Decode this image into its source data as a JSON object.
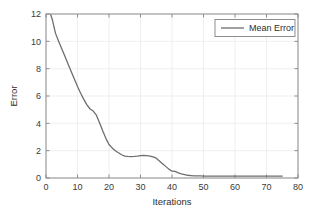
{
  "chart_data": {
    "type": "line",
    "title": "",
    "xlabel": "Iterations",
    "ylabel": "Error",
    "xlim": [
      0,
      80
    ],
    "ylim": [
      0,
      12
    ],
    "xticks": [
      0,
      10,
      20,
      30,
      40,
      50,
      60,
      70,
      80
    ],
    "yticks": [
      0,
      2,
      4,
      6,
      8,
      10,
      12
    ],
    "xtick_labels": [
      "0",
      "10",
      "20",
      "30",
      "40",
      "50",
      "60",
      "70",
      "80"
    ],
    "ytick_labels": [
      "0",
      "2",
      "4",
      "6",
      "8",
      "10",
      "12"
    ],
    "grid": true,
    "grid_color": "#ebebeb",
    "legend_position": "upper right",
    "series": [
      {
        "name": "Mean Error",
        "color": "#6e6e6e",
        "line_width": 1.3,
        "x": [
          1.5,
          2,
          3,
          4,
          5,
          6,
          7,
          8,
          9,
          10,
          11,
          12,
          13,
          14,
          15,
          16,
          17,
          18,
          19,
          20,
          21,
          22,
          23,
          24,
          25,
          26,
          27,
          28,
          29,
          30,
          31,
          32,
          33,
          34,
          35,
          36,
          37,
          38,
          39,
          40,
          41,
          42,
          43,
          44,
          45,
          46,
          47,
          48,
          49,
          50,
          52,
          55,
          58,
          60,
          63,
          66,
          70,
          73,
          75
        ],
        "y": [
          11.95,
          11.6,
          10.6,
          10.0,
          9.45,
          8.9,
          8.35,
          7.8,
          7.25,
          6.7,
          6.2,
          5.75,
          5.35,
          5.05,
          4.9,
          4.6,
          4.05,
          3.45,
          2.9,
          2.45,
          2.2,
          2.0,
          1.85,
          1.7,
          1.6,
          1.58,
          1.57,
          1.58,
          1.6,
          1.63,
          1.66,
          1.64,
          1.6,
          1.55,
          1.45,
          1.25,
          1.05,
          0.85,
          0.65,
          0.5,
          0.48,
          0.38,
          0.3,
          0.25,
          0.2,
          0.18,
          0.16,
          0.15,
          0.15,
          0.14,
          0.14,
          0.14,
          0.14,
          0.14,
          0.14,
          0.14,
          0.14,
          0.14,
          0.14
        ]
      }
    ]
  },
  "legend": {
    "entries": [
      {
        "label": "Mean Error",
        "color": "#6e6e6e"
      }
    ]
  },
  "axes": {
    "x_title": "Iterations",
    "y_title": "Error"
  }
}
